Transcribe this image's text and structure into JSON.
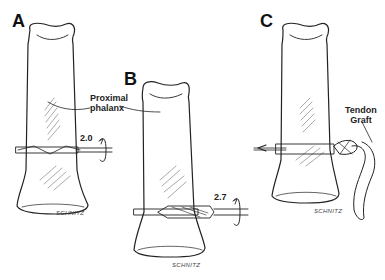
{
  "figure": {
    "panels": [
      {
        "id": "A",
        "label": "A",
        "drill_size": "2.0",
        "annotation": "Proximal phalanx",
        "annotation_lines": [
          "Proximal",
          "phalanx"
        ],
        "signature": "SCHNITZ"
      },
      {
        "id": "B",
        "label": "B",
        "drill_size": "2.7",
        "signature": "SCHNITZ"
      },
      {
        "id": "C",
        "label": "C",
        "annotation_lines": [
          "Tendon",
          "Graft"
        ],
        "signature": "SCHNITZ"
      }
    ],
    "colors": {
      "ink": "#222222",
      "background": "#ffffff"
    }
  }
}
